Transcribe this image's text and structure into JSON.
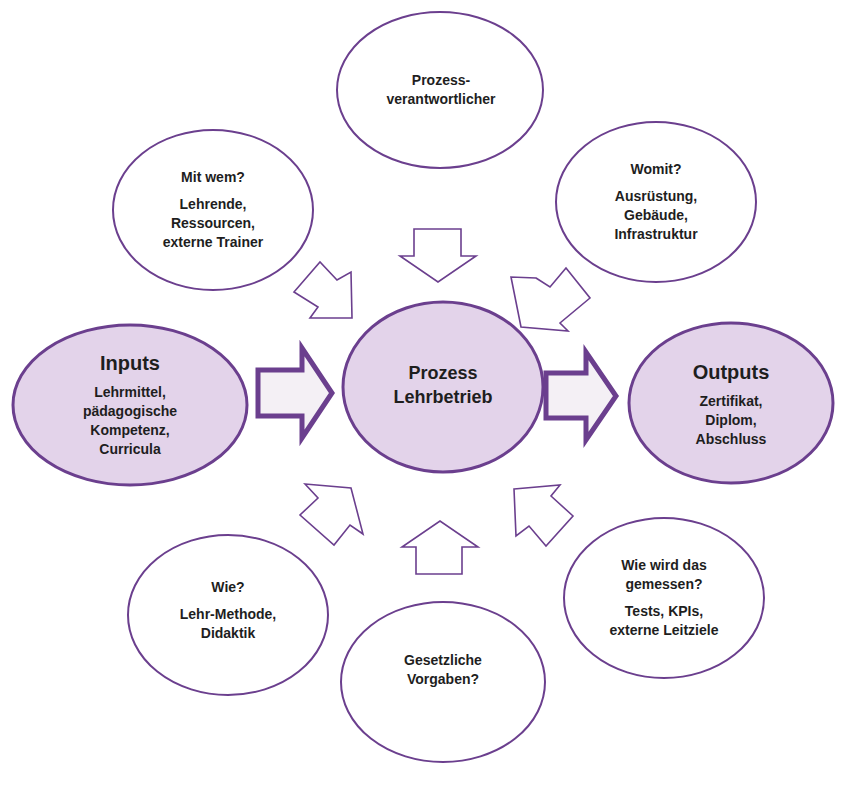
{
  "colors": {
    "stroke": "#6b3f8e",
    "fill_highlight": "#e3d3ea",
    "fill_plain": "#ffffff",
    "text": "#1e1e1e"
  },
  "nodes": {
    "center": {
      "line1": "Prozess",
      "line2": "Lehrbetrieb"
    },
    "inputs": {
      "title": "Inputs",
      "lines": [
        "Lehrmittel,",
        "pädagogische",
        "Kompetenz,",
        "Curricula"
      ]
    },
    "outputs": {
      "title": "Outputs",
      "lines": [
        "Zertifikat,",
        "Diplom,",
        "Abschluss"
      ]
    },
    "top": {
      "lines": [
        "Prozess-",
        "verantwortlicher"
      ]
    },
    "top_left": {
      "question": "Mit wem?",
      "lines": [
        "Lehrende,",
        "Ressourcen,",
        "externe Trainer"
      ]
    },
    "top_right": {
      "question": "Womit?",
      "lines": [
        "Ausrüstung,",
        "Gebäude,",
        "Infrastruktur"
      ]
    },
    "bottom_left": {
      "question": "Wie?",
      "lines": [
        "Lehr-Methode,",
        "Didaktik"
      ]
    },
    "bottom_right": {
      "question_lines": [
        "Wie wird  das",
        "gemessen?"
      ],
      "lines": [
        "Tests, KPIs,",
        "externe Leitziele"
      ]
    },
    "bottom": {
      "lines": [
        "Gesetzliche",
        "Vorgaben?"
      ]
    }
  }
}
